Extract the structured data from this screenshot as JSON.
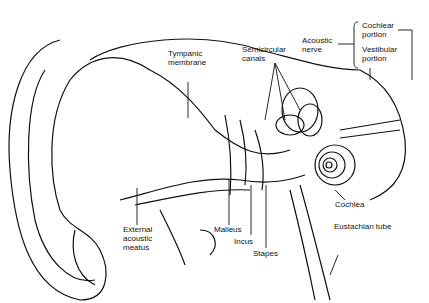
{
  "diagram": {
    "labels": {
      "tympanic": "Tympanic\nmembrane",
      "semicircular": "Semicircular\ncanals",
      "acoustic": "Acoustic\nnerve",
      "cochlear_portion": "Cochlear\nportion",
      "vestibular_portion": "Vestibular\nportion",
      "cochlea": "Cochlea",
      "eustachian": "Eustachian tube",
      "external": "External\nacoustic\nmeatus",
      "malleus": "Malleus",
      "incus": "Incus",
      "stapes": "Stapes"
    }
  }
}
